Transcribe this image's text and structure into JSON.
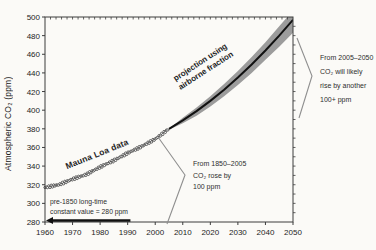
{
  "chart_data": {
    "type": "line",
    "title": "",
    "xlabel": "",
    "ylabel": "Atmospheric CO₂ (ppm)",
    "xlim": [
      1960,
      2050
    ],
    "ylim": [
      280,
      500
    ],
    "x_ticks": [
      1960,
      1970,
      1980,
      1990,
      2000,
      2010,
      2020,
      2030,
      2040,
      2050
    ],
    "y_ticks": [
      280,
      300,
      320,
      340,
      360,
      380,
      400,
      420,
      440,
      460,
      480,
      500
    ],
    "grid": false,
    "legend": "none (labels drawn along curves)",
    "series": [
      {
        "name": "Mauna Loa data",
        "type": "scatter-open-circles",
        "x": [
          1960,
          1965,
          1970,
          1975,
          1980,
          1985,
          1990,
          1995,
          2000,
          2005
        ],
        "y": [
          317,
          320,
          326,
          331,
          339,
          346,
          354,
          361,
          369,
          380
        ]
      },
      {
        "name": "projection using airborne fraction",
        "type": "line-with-uncertainty-band",
        "x": [
          2005,
          2010,
          2015,
          2020,
          2025,
          2030,
          2035,
          2040,
          2045,
          2050
        ],
        "y": [
          380,
          389,
          399,
          410,
          422,
          435,
          449,
          464,
          480,
          497
        ],
        "band_high": [
          380,
          392,
          403,
          415,
          428,
          442,
          457,
          473,
          490,
          507
        ],
        "band_low": [
          379,
          386,
          394,
          404,
          415,
          427,
          440,
          454,
          468,
          483
        ]
      }
    ],
    "series_labels": {
      "mauna_loa": "Mauna Loa data",
      "projection": "projection using\nairborne fraction"
    },
    "annotations": {
      "pre_1850": "pre-1850 long-time\nconstant value = 280 ppm",
      "rise_1850_2005": "From 1850–2005\nCO₂ rose by\n100 ppm",
      "rise_2005_2050": "From 2005–2050\nCO₂ will likely\nrise by another\n100+ ppm"
    },
    "colors": {
      "band_gray": "#9c9c9c",
      "projection_line": "#111111",
      "data_circle_stroke": "#3f3f3f",
      "axis": "#3c3c3c",
      "bracket_gray": "#8f8f8f"
    }
  }
}
